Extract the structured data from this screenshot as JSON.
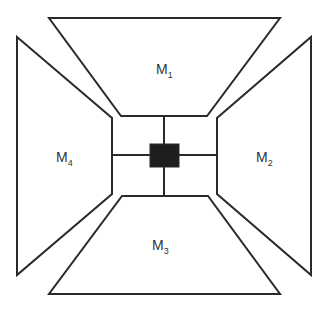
{
  "diagram": {
    "type": "mirror-panel-layout",
    "colors": {
      "stroke": "#2a2a2a",
      "hub": "#1e1e1e",
      "text": "#333333",
      "background": "#ffffff"
    },
    "panels": [
      {
        "id": "M1",
        "base": "M",
        "sub": "1",
        "position": "top"
      },
      {
        "id": "M2",
        "base": "M",
        "sub": "2",
        "position": "right"
      },
      {
        "id": "M3",
        "base": "M",
        "sub": "3",
        "position": "bottom"
      },
      {
        "id": "M4",
        "base": "M",
        "sub": "4",
        "position": "left"
      }
    ],
    "hub": {
      "description": "central black square connected to all four panels"
    }
  }
}
